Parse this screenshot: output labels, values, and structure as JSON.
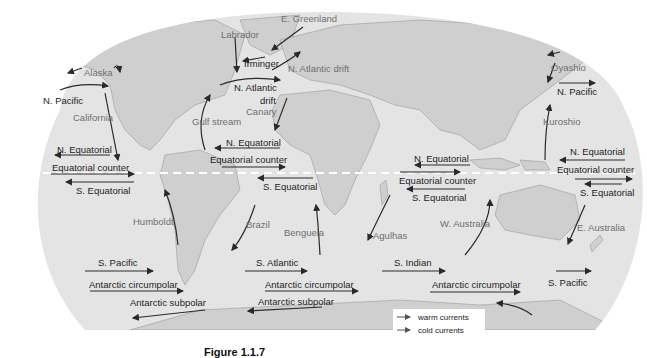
{
  "figure": {
    "caption": "Figure 1.1.7",
    "equator_line": "dashed white line"
  },
  "legend": {
    "items": [
      {
        "label": "warm currents",
        "color": "#555555"
      },
      {
        "label": "cold currents",
        "color": "#555555"
      }
    ]
  },
  "colors": {
    "ocean": "#e4e4e4",
    "land": "#cfcfcf",
    "coast": "#9a9a9a",
    "dark_label": "#1e1e1e",
    "gray_label": "#6f6f6f",
    "arrow": "#2a2a2a"
  },
  "currents": [
    {
      "name": "E. Greenland",
      "color": "gray"
    },
    {
      "name": "Labrador",
      "color": "gray"
    },
    {
      "name": "Irminger",
      "color": "dark"
    },
    {
      "name": "N. Atlantic drift",
      "color": "gray"
    },
    {
      "name": "Alaska",
      "color": "gray"
    },
    {
      "name": "N. Pacific",
      "color": "dark"
    },
    {
      "name": "California",
      "color": "gray"
    },
    {
      "name": "N. Atlantic",
      "color": "dark"
    },
    {
      "name": "drift",
      "color": "dark"
    },
    {
      "name": "Gulf stream",
      "color": "gray"
    },
    {
      "name": "Canary",
      "color": "gray"
    },
    {
      "name": "Oyashio",
      "color": "gray"
    },
    {
      "name": "N. Pacific",
      "color": "dark"
    },
    {
      "name": "Kuroshio",
      "color": "gray"
    },
    {
      "name": "N. Equatorial",
      "color": "dark"
    },
    {
      "name": "Equatorial counter",
      "color": "dark"
    },
    {
      "name": "S. Equatorial",
      "color": "dark"
    },
    {
      "name": "N. Equatorial",
      "color": "dark"
    },
    {
      "name": "Equatorial counter",
      "color": "dark"
    },
    {
      "name": "S. Equatorial",
      "color": "dark"
    },
    {
      "name": "N. Equatorial",
      "color": "dark"
    },
    {
      "name": "Equatorial counter",
      "color": "dark"
    },
    {
      "name": "S. Equatorial",
      "color": "dark"
    },
    {
      "name": "N. Equatorial",
      "color": "dark"
    },
    {
      "name": "Equatorial counter",
      "color": "dark"
    },
    {
      "name": "S. Equatorial",
      "color": "dark"
    },
    {
      "name": "Humboldt",
      "color": "gray"
    },
    {
      "name": "Brazil",
      "color": "gray"
    },
    {
      "name": "Benguela",
      "color": "gray"
    },
    {
      "name": "Agulhas",
      "color": "gray"
    },
    {
      "name": "W. Australia",
      "color": "gray"
    },
    {
      "name": "E. Australia",
      "color": "gray"
    },
    {
      "name": "S. Pacific",
      "color": "dark"
    },
    {
      "name": "Antarctic circumpolar",
      "color": "dark"
    },
    {
      "name": "Antarctic subpolar",
      "color": "dark"
    },
    {
      "name": "S. Atlantic",
      "color": "dark"
    },
    {
      "name": "Antarctic circumpolar",
      "color": "dark"
    },
    {
      "name": "Antarctic subpolar",
      "color": "dark"
    },
    {
      "name": "S. Indian",
      "color": "dark"
    },
    {
      "name": "Antarctic circumpolar",
      "color": "dark"
    },
    {
      "name": "S. Pacific",
      "color": "dark"
    }
  ]
}
